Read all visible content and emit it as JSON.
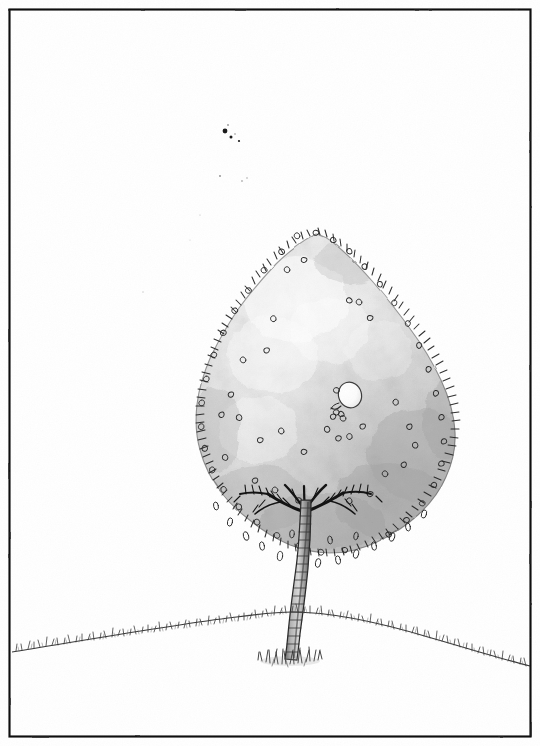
{
  "artwork": {
    "title": "Lone Tree on a Hill",
    "medium": "pen and ink with grey wash",
    "style": "hand-drawn line illustration",
    "canvas": {
      "width": 540,
      "height": 746,
      "background": "#ffffff"
    },
    "frame": {
      "label": "ink border frame",
      "x": 9,
      "y": 9,
      "width": 523,
      "height": 729,
      "stroke": "#1a1a1a",
      "stroke_width": 2.2
    },
    "palette": {
      "ink": "#1a1a1a",
      "ink_soft": "#4a4a4a",
      "paper": "#ffffff",
      "canopy_light": "#f2f2f2",
      "canopy_mid": "#dcdcdc",
      "canopy_dark": "#b4b4b4",
      "canopy_edge": "#9a9a9a",
      "trunk_light": "#c9c9c9",
      "trunk_dark": "#5a5a5a",
      "grass": "#4f4f4f",
      "highlight": "#fdfdfd"
    },
    "subjects": [
      {
        "name": "canopy",
        "label": "Tree canopy",
        "shape": "broad teardrop / triangular mass",
        "apex": {
          "x": 316,
          "y": 232
        },
        "left_extent": {
          "x": 198,
          "y": 470
        },
        "right_extent": {
          "x": 452,
          "y": 468
        },
        "bottom": {
          "x": 320,
          "y": 552
        },
        "texture": "mottled grey wash with stippled leaf curls along the silhouette"
      },
      {
        "name": "trunk",
        "label": "Tree trunk",
        "top": {
          "x": 305,
          "y": 498
        },
        "base": {
          "x": 290,
          "y": 658
        },
        "width_top": 9,
        "width_base": 13,
        "texture": "horizontal birch-like bark bands"
      },
      {
        "name": "branches",
        "label": "Branch fan under canopy",
        "origin": {
          "x": 305,
          "y": 505
        },
        "spread": "radiating dark limbs left and right"
      },
      {
        "name": "white-oval",
        "label": "Pale oval in canopy",
        "center": {
          "x": 350,
          "y": 395
        },
        "rx": 11,
        "ry": 13,
        "fill": "#fcfcfc",
        "stroke": "#3a3a3a"
      },
      {
        "name": "ground-line",
        "label": "Grassy horizon",
        "left_end": {
          "x": 12,
          "y": 652
        },
        "crest": {
          "x": 292,
          "y": 612
        },
        "right_end": {
          "x": 530,
          "y": 666
        },
        "texture": "fine vertical grass ticks along a gentle rise"
      },
      {
        "name": "grass-tuft",
        "label": "Grass tuft at trunk base",
        "center": {
          "x": 290,
          "y": 655
        },
        "width": 52
      },
      {
        "name": "ink-specks",
        "label": "Stray ink specks in sky",
        "points": [
          {
            "x": 225,
            "y": 131,
            "r": 2.4
          },
          {
            "x": 231,
            "y": 137,
            "r": 1.5
          },
          {
            "x": 239,
            "y": 141,
            "r": 1.1
          },
          {
            "x": 220,
            "y": 176,
            "r": 0.9
          },
          {
            "x": 242,
            "y": 181,
            "r": 0.8
          },
          {
            "x": 247,
            "y": 178,
            "r": 0.7
          }
        ]
      }
    ]
  }
}
